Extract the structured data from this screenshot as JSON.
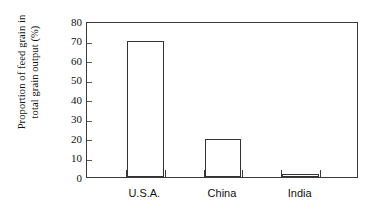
{
  "chart_data": {
    "type": "bar",
    "title": "",
    "subtitle": "",
    "xlabel": "",
    "ylabel": "Proportion of feed grain in total grain output (%)",
    "ylabel_lines": [
      "Proportion of feed grain in",
      "total grain output (%)"
    ],
    "categories": [
      "U.S.A.",
      "China",
      "India"
    ],
    "values": [
      70,
      19.5,
      1
    ],
    "series": [
      {
        "name": "Proportion of feed grain in total grain output (%)",
        "values": [
          70,
          19.5,
          1
        ]
      }
    ],
    "ylim": [
      0,
      80
    ],
    "yticks": [
      0,
      10,
      20,
      30,
      40,
      50,
      60,
      70,
      80
    ],
    "ytick_labels": [
      "0",
      "10",
      "20",
      "30",
      "40",
      "50",
      "60",
      "70",
      "80"
    ],
    "grid": false,
    "legend": false,
    "legend_position": "none",
    "bar_fill_color": "#ffffff",
    "bar_edge_color": "#333333",
    "axis_color": "#3a3a3a",
    "background_color": "#ffffff",
    "annotations": []
  }
}
